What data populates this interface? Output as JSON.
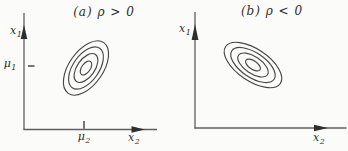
{
  "figure": {
    "background_color": "#fbfbf9",
    "axis_color": "#5f5f5f",
    "contour_color": "#474747",
    "ink_color": "#2e2e2e",
    "panels": [
      {
        "title": "(a) ρ > 0",
        "correlation_sign": "positive",
        "contour_count": 4,
        "contour_tilt": "up-right",
        "y_axis_label": {
          "base": "x",
          "sub": "1"
        },
        "x_axis_label": {
          "base": "x",
          "sub": "2"
        },
        "y_tick_label": {
          "base": "μ",
          "sub": "1"
        },
        "x_tick_label": {
          "base": "μ",
          "sub": "2"
        }
      },
      {
        "title": "(b) ρ < 0",
        "correlation_sign": "negative",
        "contour_count": 4,
        "contour_tilt": "down-right",
        "y_axis_label": {
          "base": "x",
          "sub": "1"
        },
        "x_axis_label": {
          "base": "x",
          "sub": "2"
        }
      }
    ]
  }
}
